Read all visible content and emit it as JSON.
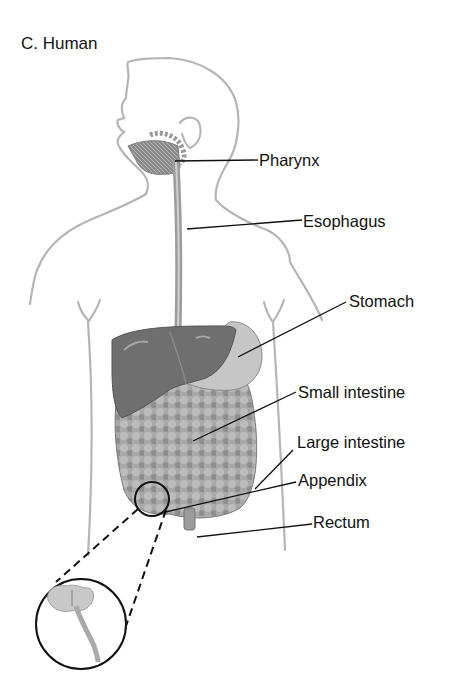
{
  "title": "C. Human",
  "labels": [
    {
      "id": "pharynx",
      "text": "Pharynx",
      "x": 259,
      "y": 153
    },
    {
      "id": "esophagus",
      "text": "Esophagus",
      "x": 303,
      "y": 213
    },
    {
      "id": "stomach",
      "text": "Stomach",
      "x": 349,
      "y": 292
    },
    {
      "id": "small-intestine",
      "text": "Small intestine",
      "x": 298,
      "y": 384
    },
    {
      "id": "large-intestine",
      "text": "Large intestine",
      "x": 297,
      "y": 433
    },
    {
      "id": "appendix",
      "text": "Appendix",
      "x": 298,
      "y": 473
    },
    {
      "id": "rectum",
      "text": "Rectum",
      "x": 313,
      "y": 513
    }
  ],
  "colors": {
    "outline": "#b0b0b0",
    "organ_dark": "#6e6e6e",
    "organ_mid": "#9a9a9a",
    "organ_light": "#c8c8c8",
    "leader": "#111111"
  }
}
